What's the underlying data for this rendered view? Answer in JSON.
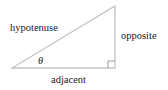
{
  "diagram": {
    "type": "right-triangle",
    "labels": {
      "hypotenuse": "hypotenuse",
      "opposite": "opposite",
      "adjacent": "adjacent",
      "angle": "θ"
    },
    "colors": {
      "line": "#c8c8c8",
      "text": "#222222"
    }
  }
}
